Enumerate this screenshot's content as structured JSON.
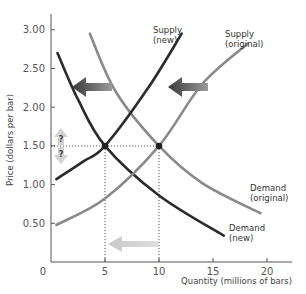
{
  "chart_data": {
    "type": "line",
    "title": "",
    "xlabel": "Quantity (millions of bars)",
    "ylabel": "Price (dollars per bar)",
    "xlim": [
      0,
      23
    ],
    "ylim": [
      0,
      3.2
    ],
    "x_ticks": [
      "0",
      "5",
      "10",
      "15",
      "20"
    ],
    "y_ticks": [
      "0.50",
      "1.00",
      "1.50",
      "2.00",
      "2.50",
      "3.00"
    ],
    "grid": false,
    "series": [
      {
        "name": "Demand (original)",
        "label_lines": [
          "Demand",
          "(original)"
        ],
        "color": "#8a8a8a",
        "points": [
          [
            3.6,
            2.95
          ],
          [
            6,
            2.2
          ],
          [
            10,
            1.5
          ],
          [
            14,
            1.02
          ],
          [
            19.4,
            0.63
          ]
        ]
      },
      {
        "name": "Demand (new)",
        "label_lines": [
          "Demand",
          "(new)"
        ],
        "color": "#2b2b2b",
        "points": [
          [
            0.6,
            2.7
          ],
          [
            2.5,
            2.1
          ],
          [
            5,
            1.5
          ],
          [
            10,
            0.86
          ],
          [
            16,
            0.34
          ]
        ]
      },
      {
        "name": "Supply (original)",
        "label_lines": [
          "Supply",
          "(original)"
        ],
        "color": "#8a8a8a",
        "points": [
          [
            0.5,
            0.48
          ],
          [
            5,
            0.82
          ],
          [
            10,
            1.5
          ],
          [
            14,
            2.3
          ],
          [
            18.2,
            2.82
          ]
        ]
      },
      {
        "name": "Supply (new)",
        "label_lines": [
          "Supply",
          "(new)"
        ],
        "color": "#2b2b2b",
        "points": [
          [
            0.5,
            1.07
          ],
          [
            3,
            1.3
          ],
          [
            5,
            1.5
          ],
          [
            9,
            2.25
          ],
          [
            12.1,
            2.95
          ]
        ]
      }
    ],
    "equilibria": [
      {
        "name": "original",
        "x": 10,
        "y": 1.5
      },
      {
        "name": "new",
        "x": 5,
        "y": 1.5
      }
    ],
    "annotations": [
      {
        "type": "arrow-left",
        "desc": "demand shift left",
        "from_x": 7,
        "to_x": 3,
        "y": 2.25,
        "color": "#4a4a4a"
      },
      {
        "type": "arrow-left",
        "desc": "supply shift left",
        "from_x": 14.6,
        "to_x": 10.8,
        "y": 2.25,
        "color": "#4a4a4a"
      },
      {
        "type": "arrow-left",
        "desc": "quantity decrease",
        "from_x": 10,
        "to_x": 5,
        "y": 0.22,
        "color": "#cfcfcf"
      },
      {
        "type": "arrow-updown",
        "desc": "price change ambiguous",
        "x": 1.3,
        "y": 1.5,
        "labels": [
          "?",
          "?"
        ]
      }
    ]
  },
  "labels": {
    "q_up": "?",
    "q_down": "?"
  }
}
